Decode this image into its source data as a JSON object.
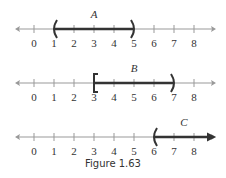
{
  "figure": {
    "caption": "Figure 1.63",
    "tick_values": [
      "0",
      "1",
      "2",
      "3",
      "4",
      "5",
      "6",
      "7",
      "8"
    ],
    "axis_color": "#999999",
    "interval_color": "#333333"
  },
  "number_lines": [
    {
      "label": "A",
      "start": 1,
      "end": 5,
      "left_bracket": "(",
      "right_bracket": ")",
      "notation": "(1, 5)"
    },
    {
      "label": "B",
      "start": 3,
      "end": 7,
      "left_bracket": "[",
      "right_bracket": ")",
      "notation": "[3, 7)"
    },
    {
      "label": "C",
      "start": 6,
      "end": "infinity",
      "left_bracket": "(",
      "right_bracket": "arrow",
      "notation": "(6, ∞)"
    }
  ]
}
